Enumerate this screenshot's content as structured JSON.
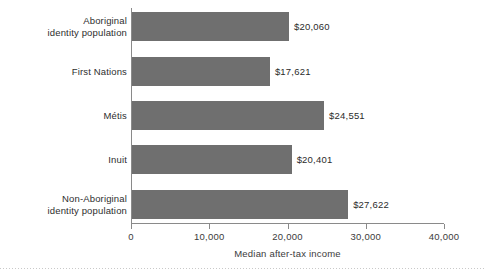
{
  "chart_data": {
    "type": "bar",
    "orientation": "horizontal",
    "title": "",
    "xlabel": "Median after-tax income",
    "ylabel": "",
    "categories": [
      "Aboriginal identity population",
      "First Nations",
      "Métis",
      "Inuit",
      "Non-Aboriginal identity population"
    ],
    "category_lines": [
      [
        "Aboriginal",
        "identity population"
      ],
      [
        "First Nations"
      ],
      [
        "Métis"
      ],
      [
        "Inuit"
      ],
      [
        "Non-Aboriginal",
        "identity population"
      ]
    ],
    "values": [
      20060,
      17621,
      24551,
      20401,
      27622
    ],
    "value_labels": [
      "$20,060",
      "$17,621",
      "$24,551",
      "$20,401",
      "$27,622"
    ],
    "xlim": [
      0,
      40000
    ],
    "xticks": [
      0,
      10000,
      20000,
      30000,
      40000
    ],
    "xtick_labels": [
      "0",
      "10,000",
      "20,000",
      "30,000",
      "40,000"
    ],
    "grid": false,
    "legend": null,
    "bar_color": "#6f6f6f",
    "axis_color": "#8a8a8a",
    "text_color": "#2e2e2e"
  }
}
